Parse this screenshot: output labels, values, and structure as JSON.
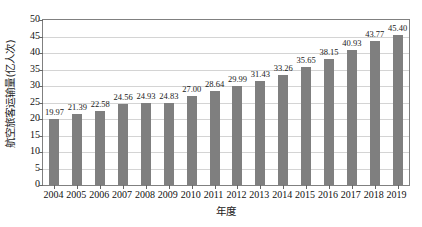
{
  "chart_data": {
    "type": "bar",
    "title": "",
    "subtitle": "",
    "xlabel": "年度",
    "ylabel": "航空旅客运输量(亿人次)",
    "categories": [
      "2004",
      "2005",
      "2006",
      "2007",
      "2008",
      "2009",
      "2010",
      "2011",
      "2012",
      "2013",
      "2014",
      "2015",
      "2016",
      "2017",
      "2018",
      "2019"
    ],
    "values": [
      19.97,
      21.39,
      22.58,
      24.56,
      24.93,
      24.83,
      27.0,
      28.64,
      29.99,
      31.43,
      33.26,
      35.65,
      38.15,
      40.93,
      43.77,
      45.4
    ],
    "data_labels": [
      "19.97",
      "21.39",
      "22.58",
      "24.56",
      "24.93",
      "24.83",
      "27.00",
      "28.64",
      "29.99",
      "31.43",
      "33.26",
      "35.65",
      "38.15",
      "40.93",
      "43.77",
      "45.40"
    ],
    "ylim": [
      0,
      50
    ],
    "ytick_step": 5,
    "ytick_labels": [
      "0",
      "5",
      "10",
      "15",
      "20",
      "25",
      "30",
      "35",
      "40",
      "45",
      "50"
    ],
    "grid": true,
    "grid_axis": "y",
    "legend": null,
    "legend_position": "none",
    "series": [
      {
        "name": "航空旅客运输量",
        "values": [
          19.97,
          21.39,
          22.58,
          24.56,
          24.93,
          24.83,
          27.0,
          28.64,
          29.99,
          31.43,
          33.26,
          35.65,
          38.15,
          40.93,
          43.77,
          45.4
        ]
      }
    ],
    "colors": {
      "bar": "#7f7f7f",
      "grid": "#d4d4d4",
      "frame": "#808080",
      "text": "#1a1a1a",
      "background": "#ffffff"
    }
  }
}
